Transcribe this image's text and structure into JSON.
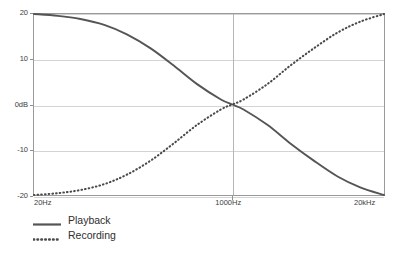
{
  "chart_data": {
    "type": "line",
    "title": "",
    "subtitle": "",
    "xlabel": "",
    "ylabel": "",
    "xscale": "log",
    "grid": true,
    "legend_position": "bottom-left",
    "x_tick_labels": [
      "20Hz",
      "1000Hz",
      "20kHz"
    ],
    "x_tick_values": [
      20,
      1000,
      20000
    ],
    "y_tick_labels": [
      "20",
      "10",
      "0dB",
      "-10",
      "-20"
    ],
    "y_tick_values": [
      20,
      10,
      0,
      -10,
      -20
    ],
    "ylim": [
      -20,
      20
    ],
    "xlim": [
      20,
      20000
    ],
    "y_unit": "dB",
    "series": [
      {
        "name": "Playback",
        "style": "solid",
        "color": "#555555",
        "x": [
          20,
          32,
          50,
          80,
          125,
          200,
          315,
          500,
          800,
          1000,
          1250,
          2000,
          3150,
          5000,
          8000,
          12500,
          20000
        ],
        "values": [
          20.0,
          19.6,
          18.9,
          17.6,
          15.5,
          12.4,
          8.6,
          4.5,
          1.1,
          0.0,
          -1.1,
          -4.5,
          -8.6,
          -12.4,
          -15.9,
          -18.3,
          -20.0
        ]
      },
      {
        "name": "Recording",
        "style": "dotted",
        "color": "#4a4a4a",
        "x": [
          20,
          32,
          50,
          80,
          125,
          200,
          315,
          500,
          800,
          1000,
          1250,
          2000,
          3150,
          5000,
          8000,
          12500,
          20000
        ],
        "values": [
          -20.0,
          -19.6,
          -18.9,
          -17.6,
          -15.5,
          -12.4,
          -8.6,
          -4.5,
          -1.1,
          0.0,
          1.1,
          4.5,
          8.6,
          12.4,
          15.9,
          18.3,
          20.0
        ]
      }
    ],
    "annotations": []
  },
  "legend": {
    "items": [
      {
        "label": "Playback",
        "style": "solid"
      },
      {
        "label": "Recording",
        "style": "dotted"
      }
    ]
  },
  "colors": {
    "playback": "#555555",
    "recording": "#4a4a4a",
    "gridline": "#d4d4d4",
    "center_gridline": "#b6b6b6",
    "frame": "#9a9a9a",
    "axis_text": "#3d3d3d",
    "legend_text": "#2e2e2e",
    "background": "#ffffff"
  }
}
